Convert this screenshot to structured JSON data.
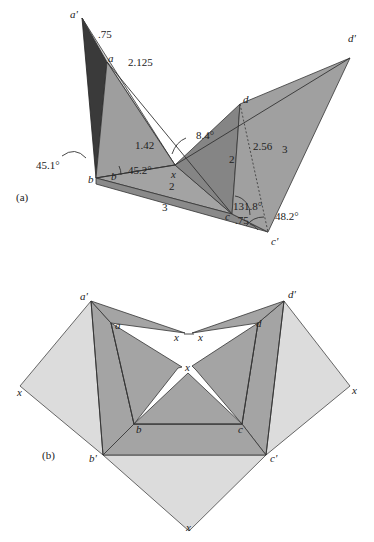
{
  "figure": {
    "panel_a": {
      "label": "(a)",
      "vertices": {
        "a_prime": "a'",
        "a": "a",
        "b_outer": "b",
        "b": "b",
        "c": "c",
        "c_prime": "c'",
        "d": "d",
        "d_prime": "d'",
        "x": "x"
      },
      "lengths": {
        "a_prime_a": ".75",
        "a_prime_x": "2.125",
        "b_x": "1.42",
        "b_c": "2",
        "b_c_prime": "3",
        "c_d": "2",
        "c_prime_d_dotted": "2.56",
        "c_prime_d_prime": "3",
        "c_c_prime": ".75"
      },
      "angles": {
        "at_x": "8.4°",
        "at_b_outer": "45.1°",
        "at_b": "45.2°",
        "at_c": "131.8°",
        "at_c_prime": "48.2°"
      }
    },
    "panel_b": {
      "label": "(b)",
      "vertices": {
        "a_prime": "a'",
        "a": "a",
        "b_prime": "b'",
        "b": "b",
        "c": "c",
        "c_prime": "c'",
        "d": "d",
        "d_prime": "d'",
        "x_left": "x",
        "x_right": "x",
        "x_bottom": "x",
        "x_center": "x",
        "x_top_left": "x",
        "x_top_right": "x"
      }
    },
    "colors": {
      "light_face": "#dcdcdc",
      "mid_face": "#a9a9a9",
      "mid_dark_face": "#8f8f8f",
      "dark_face": "#3a3a3a",
      "edge": "#333333"
    }
  }
}
